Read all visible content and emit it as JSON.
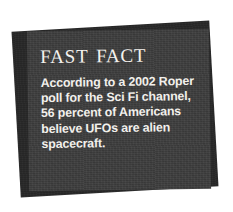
{
  "card": {
    "title": "Fast Fact",
    "body_lines": [
      "According to a 2002 Roper",
      "poll for the Sci Fi channel,",
      "56 percent of Americans",
      "believe UFOs are alien",
      "spacecraft."
    ],
    "body_text": "According to a 2002 Roper poll for the Sci Fi channel, 56 percent of Americans believe UFOs are alien spacecraft."
  },
  "colors": {
    "page_background": "#ffffff",
    "card_background": "#3b3b3b",
    "back_card_background": "#262626",
    "text": "#f2f0ec",
    "title_text": "#f4f2ee"
  }
}
